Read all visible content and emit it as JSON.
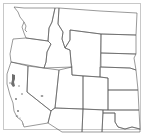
{
  "map": {
    "type": "range-map",
    "region": "Western United States",
    "colors": {
      "background": "#ffffff",
      "frame": "#c8c8c8",
      "boundary": "#555555",
      "range_fill": "#6e6e6e"
    },
    "states_visible": [
      "WA",
      "OR",
      "CA",
      "ID",
      "NV",
      "MT",
      "WY",
      "UT",
      "AZ",
      "CO",
      "NM",
      "ND",
      "SD",
      "NE",
      "KS",
      "OK",
      "TX"
    ],
    "range_areas": [
      {
        "name": "north-coast-california",
        "approx_xy": [
          13,
          80
        ]
      },
      {
        "name": "central-valley-spot",
        "approx_xy": [
          20,
          86
        ]
      },
      {
        "name": "sierra-spot",
        "approx_xy": [
          22,
          94
        ]
      },
      {
        "name": "central-coast-spot",
        "approx_xy": [
          15,
          99
        ]
      },
      {
        "name": "nevada-spot",
        "approx_xy": [
          42,
          96
        ]
      },
      {
        "name": "southern-california-spot",
        "approx_xy": [
          18,
          111
        ]
      },
      {
        "name": "southern-california-coast",
        "approx_xy": [
          16,
          116
        ]
      },
      {
        "name": "san-diego-spot",
        "approx_xy": [
          23,
          124
        ]
      }
    ]
  }
}
